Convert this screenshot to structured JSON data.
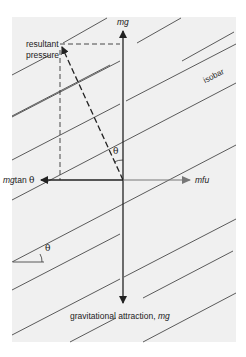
{
  "diagram": {
    "labels": {
      "resultant_line1": "resultant",
      "resultant_line2": "pressure",
      "mg_top": "mg",
      "isobar": "isobar",
      "theta_center": "θ",
      "mgtan": "mgtan θ",
      "mfu": "mfu",
      "theta_corner": "θ",
      "gravitational": "gravitational attraction, ",
      "gravitational_mg": "mg"
    },
    "colors": {
      "background_panel": "#f0f0f0",
      "lines": "#222222",
      "mfu_arrow": "#666666"
    }
  }
}
